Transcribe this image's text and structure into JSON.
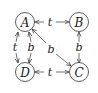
{
  "diagram": {
    "nodes": [
      {
        "id": "A",
        "label": "A",
        "x": 25,
        "y": 22
      },
      {
        "id": "B",
        "label": "B",
        "x": 79,
        "y": 22
      },
      {
        "id": "C",
        "label": "C",
        "x": 79,
        "y": 72
      },
      {
        "id": "D",
        "label": "D",
        "x": 25,
        "y": 72
      }
    ],
    "edges": [
      {
        "from": "A",
        "to": "B",
        "label": "t",
        "direction": "both"
      },
      {
        "from": "D",
        "to": "C",
        "label": "t",
        "direction": "both"
      },
      {
        "from": "A",
        "to": "D",
        "label": "t",
        "direction": "both"
      },
      {
        "from": "A",
        "to": "D",
        "label": "b",
        "direction": "both"
      },
      {
        "from": "B",
        "to": "C",
        "label": "b",
        "direction": "both"
      },
      {
        "from": "A",
        "to": "C",
        "label": "b",
        "direction": "both"
      }
    ]
  }
}
